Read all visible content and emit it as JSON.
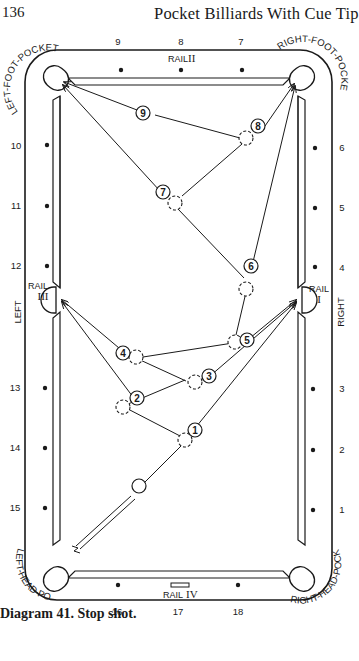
{
  "page": {
    "number": "136",
    "running_head": "Pocket Billiards With Cue Tip",
    "caption": "Diagram 41. Stop shot."
  },
  "table": {
    "pockets": {
      "left_foot": "LEFT-FOOT-POCKET",
      "right_foot": "RIGHT-FOOT-POCKET",
      "left_head": "LEFT-HEAD-POCKET",
      "right_head": "RIGHT-HEAD-POCKET",
      "left_side": "LEFT",
      "right_side": "RIGHT"
    },
    "rails": {
      "rail_1": {
        "word": "RAIL",
        "numeral": "I"
      },
      "rail_2": {
        "word": "RAIL",
        "numeral": "II"
      },
      "rail_3": {
        "word": "RAIL",
        "numeral": "III"
      },
      "rail_4": {
        "word": "RAIL",
        "numeral": "IV"
      }
    },
    "diamonds": {
      "top": [
        "9",
        "8",
        "7"
      ],
      "bottom": [
        "16",
        "17",
        "18"
      ],
      "left": [
        "10",
        "11",
        "12",
        "13",
        "14",
        "15"
      ],
      "right": [
        "6",
        "5",
        "4",
        "3",
        "2",
        "1"
      ]
    }
  },
  "balls": [
    {
      "n": "1",
      "label": "1"
    },
    {
      "n": "2",
      "label": "2"
    },
    {
      "n": "3",
      "label": "3"
    },
    {
      "n": "4",
      "label": "4"
    },
    {
      "n": "5",
      "label": "5"
    },
    {
      "n": "6",
      "label": "6"
    },
    {
      "n": "7",
      "label": "7"
    },
    {
      "n": "8",
      "label": "8"
    },
    {
      "n": "9",
      "label": "9"
    }
  ]
}
